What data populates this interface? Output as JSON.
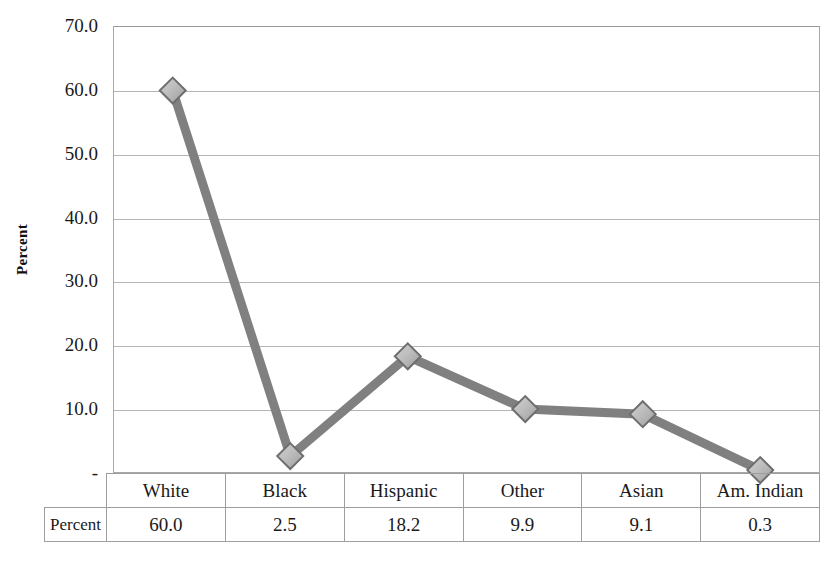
{
  "chart_data": {
    "type": "line",
    "title": "",
    "xlabel": "",
    "ylabel": "Percent",
    "categories": [
      "White",
      "Black",
      "Hispanic",
      "Other",
      "Asian",
      "Am. Indian"
    ],
    "values": [
      60.0,
      2.5,
      18.2,
      9.9,
      9.1,
      0.3
    ],
    "series": [
      {
        "name": "Percent",
        "values": [
          60.0,
          2.5,
          18.2,
          9.9,
          9.1,
          0.3
        ]
      }
    ],
    "ylim": [
      0,
      70
    ],
    "ytick_labels": [
      "70.0",
      "60.0",
      "50.0",
      "40.0",
      "30.0",
      "20.0",
      "10.0",
      "-"
    ],
    "ytick_values": [
      70,
      60,
      50,
      40,
      30,
      20,
      10,
      0
    ],
    "grid": true,
    "legend": false,
    "marker": "diamond",
    "line_color": "#808080",
    "marker_fill": "#b5b5b5",
    "marker_border": "#6e6e6e",
    "grid_color": "#b4b4b4",
    "axis_color": "#a8a8a8",
    "background": "#ffffff"
  },
  "table": {
    "row_header": "Percent",
    "columns": [
      "White",
      "Black",
      "Hispanic",
      "Other",
      "Asian",
      "Am. Indian"
    ],
    "values": [
      "60.0",
      "2.5",
      "18.2",
      "9.9",
      "9.1",
      "0.3"
    ]
  }
}
